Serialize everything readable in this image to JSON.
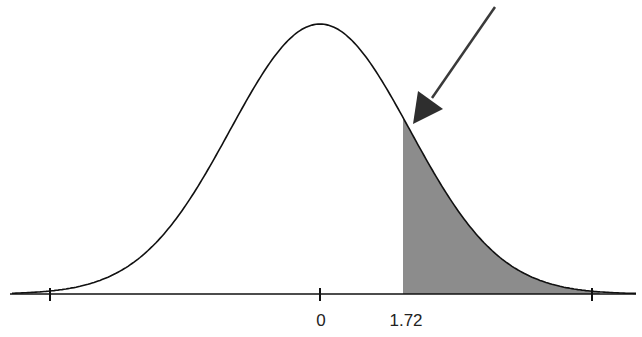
{
  "chart_data": {
    "type": "area",
    "title": "",
    "xlabel": "",
    "ylabel": "",
    "x_tick_labels": [
      {
        "value": 0,
        "label": "0"
      },
      {
        "value": 1.72,
        "label": "1.72"
      }
    ],
    "unlabeled_ticks": [
      -3,
      3
    ],
    "shaded_region": {
      "from": 1.72,
      "to": "infinity",
      "color": "#8c8c8c"
    },
    "curve": {
      "mean": 0,
      "sd": 1,
      "color": "#111111"
    },
    "annotation": {
      "type": "arrow",
      "pointing_to": "curve at z = 1.72",
      "color": "#444444"
    },
    "grid": false,
    "legend": null
  },
  "labels": {
    "zero": "0",
    "z": "1.72"
  },
  "colors": {
    "curve": "#111111",
    "shade": "#8c8c8c",
    "axis": "#111111",
    "arrow": "#3a3a3a"
  }
}
